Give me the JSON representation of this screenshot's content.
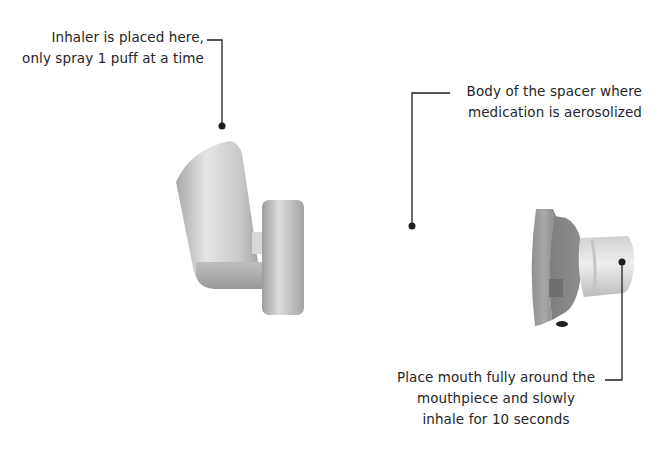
{
  "diagram": {
    "colors": {
      "background": "#ffffff",
      "text": "#262626",
      "leader_line": "#1e1e1e",
      "part_light": "#e6e6e6",
      "part_mid": "#bdbdbd",
      "part_dark": "#8c8c8c"
    },
    "callouts": [
      {
        "id": "inhaler-port",
        "lines": [
          "Inhaler is placed here,",
          "only spray 1 puff at a time"
        ],
        "anchor": [
          222,
          126
        ]
      },
      {
        "id": "spacer-body",
        "lines": [
          "Body of the spacer where",
          "medication is aerosolized"
        ],
        "anchor": [
          412,
          226
        ]
      },
      {
        "id": "mouthpiece",
        "lines": [
          "Place mouth fully around the",
          "mouthpiece and slowly",
          "inhale for 10 seconds"
        ],
        "anchor": [
          622,
          262
        ]
      }
    ],
    "parts": [
      {
        "name": "inhaler-canister-housing"
      },
      {
        "name": "inhaler-adapter-ring"
      },
      {
        "name": "spacer-chamber"
      },
      {
        "name": "mouthpiece-end-cap"
      },
      {
        "name": "mouthpiece"
      }
    ]
  }
}
